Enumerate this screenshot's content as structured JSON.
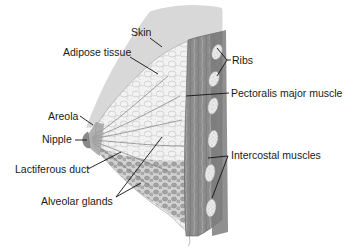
{
  "diagram": {
    "colors": {
      "background": "#ffffff",
      "skin": "#d9d9d9",
      "adipose": "#efefef",
      "muscle": "#8a8a8a",
      "muscle_dark": "#6e6e6e",
      "rib": "#e6e6e6",
      "glands": "#a9a9a9",
      "label_text": "#1a1a1a",
      "leader_line": "#111111"
    },
    "labels": [
      {
        "id": "skin",
        "text": "Skin"
      },
      {
        "id": "adipose",
        "text": "Adipose tissue"
      },
      {
        "id": "ribs",
        "text": "Ribs"
      },
      {
        "id": "pectoralis",
        "text": "Pectoralis major muscle"
      },
      {
        "id": "areola",
        "text": "Areola"
      },
      {
        "id": "nipple",
        "text": "Nipple"
      },
      {
        "id": "lactiferous",
        "text": "Lactiferous duct"
      },
      {
        "id": "intercostal",
        "text": "Intercostal muscles"
      },
      {
        "id": "alveolar",
        "text": "Alveolar glands"
      }
    ]
  }
}
